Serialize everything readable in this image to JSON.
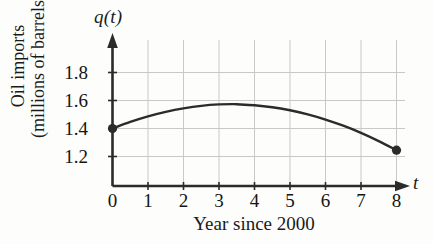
{
  "chart_data": {
    "type": "line",
    "title": "",
    "subtitle": "",
    "xlabel": "Year since 2000",
    "ylabel": "Oil imports (millions of barrels)",
    "ylabel_line1": "Oil imports",
    "ylabel_line2": "(millions of barrels)",
    "y_axis_symbol": "q(t)",
    "x_axis_symbol": "t",
    "grid": true,
    "legend": "none",
    "xlim": [
      0,
      8
    ],
    "ylim": [
      1.1,
      1.9
    ],
    "x_ticks": [
      "0",
      "1",
      "2",
      "3",
      "4",
      "5",
      "6",
      "7",
      "8"
    ],
    "x_tick_values": [
      0,
      1,
      2,
      3,
      4,
      5,
      6,
      7,
      8
    ],
    "y_ticks": [
      "1.2",
      "1.4",
      "1.6",
      "1.8"
    ],
    "y_tick_values": [
      1.2,
      1.4,
      1.6,
      1.8
    ],
    "series": [
      {
        "name": "q(t)",
        "color": "#2b2b2b",
        "x": [
          0,
          0.5,
          1,
          1.5,
          2,
          2.5,
          3,
          3.4,
          3.5,
          4,
          4.5,
          5,
          5.5,
          6,
          6.5,
          7,
          7.5,
          8
        ],
        "values": [
          1.4,
          1.447,
          1.487,
          1.519,
          1.544,
          1.562,
          1.572,
          1.574,
          1.573,
          1.566,
          1.552,
          1.53,
          1.501,
          1.464,
          1.42,
          1.369,
          1.31,
          1.245
        ]
      }
    ],
    "markers": [
      {
        "label": "start-point",
        "x": 0,
        "y": 1.4
      },
      {
        "label": "end-point",
        "x": 8,
        "y": 1.245
      }
    ],
    "annotations": []
  },
  "style": {
    "axis_color": "#2b2b2b",
    "grid_color": "#c9c9c9",
    "curve_color": "#2b2b2b",
    "marker_color": "#2b2b2b",
    "background": "#fdfdfc"
  }
}
